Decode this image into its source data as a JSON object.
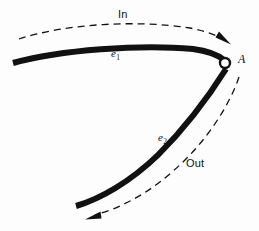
{
  "figure": {
    "name": "in-out-edge-vertex-diagram",
    "background_color": "#fdfdfd",
    "stroke_color": "#111111",
    "vertex_fill_color": "#ffffff",
    "labels": {
      "in": "In",
      "out": "Out",
      "edge_1_base": "e",
      "edge_1_sub": "1",
      "edge_2_base": "e",
      "edge_2_sub": "2",
      "vertex": "A"
    }
  },
  "elements": {
    "edge_1": {
      "name": "edge-e1-thick-curve",
      "path": "M 13,63 C 60,50 140,44 193,49 C 208,51 218,55 224,60",
      "stroke_width": 6
    },
    "edge_2": {
      "name": "edge-e2-thick-curve",
      "path": "M 226,69 C 214,88 190,123 158,155 C 130,182 100,199 76,206",
      "stroke_width": 6
    },
    "vertex_marker": {
      "name": "vertex-a-circle",
      "cx": 225,
      "cy": 63,
      "r": 5,
      "stroke_width": 2.4
    },
    "in_arc": {
      "name": "in-direction-dashed-arc",
      "path": "M 19,39 C 68,23 140,20 190,28 C 205,31 217,35 226,41",
      "stroke_width": 1.3,
      "dash": "7 5"
    },
    "in_arrowhead": {
      "name": "in-direction-arrowhead",
      "points": "230,44 216,37 219,32"
    },
    "out_arc": {
      "name": "out-direction-dashed-arc",
      "path": "M 239,77 C 230,104 207,142 172,172 C 145,196 117,209 95,215",
      "stroke_width": 1.3,
      "dash": "7 5"
    },
    "out_arrowhead": {
      "name": "out-direction-arrowhead",
      "points": "86,219 100,212 101,218"
    }
  }
}
